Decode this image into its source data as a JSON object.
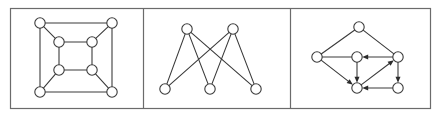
{
  "figure": {
    "title": "",
    "background_color": "#ffffff",
    "frame_color": "#6b6b6b",
    "edge_color": "#3b3b3b",
    "node_fill": "#ffffff",
    "node_stroke": "#3b3b3b",
    "node_radius": 5.2,
    "frame": {
      "x": 10,
      "y": 8,
      "width": 420,
      "height": 100
    },
    "dividers": [
      143,
      290
    ],
    "panels": [
      {
        "id": "panel-1",
        "name": "cube-graph-nested-squares",
        "type": "undirected",
        "node_count": 8,
        "edge_count": 12,
        "nodes": [
          {
            "id": "o-tl",
            "x": 40,
            "y": 23
          },
          {
            "id": "o-tr",
            "x": 112,
            "y": 23
          },
          {
            "id": "o-bl",
            "x": 40,
            "y": 92
          },
          {
            "id": "o-br",
            "x": 112,
            "y": 92
          },
          {
            "id": "i-tl",
            "x": 59,
            "y": 42
          },
          {
            "id": "i-tr",
            "x": 92,
            "y": 42
          },
          {
            "id": "i-bl",
            "x": 59,
            "y": 70
          },
          {
            "id": "i-br",
            "x": 92,
            "y": 70
          }
        ],
        "edges": [
          {
            "from": "o-tl",
            "to": "o-tr"
          },
          {
            "from": "o-tr",
            "to": "o-br"
          },
          {
            "from": "o-br",
            "to": "o-bl"
          },
          {
            "from": "o-bl",
            "to": "o-tl"
          },
          {
            "from": "i-tl",
            "to": "i-tr"
          },
          {
            "from": "i-tr",
            "to": "i-br"
          },
          {
            "from": "i-br",
            "to": "i-bl"
          },
          {
            "from": "i-bl",
            "to": "i-tl"
          },
          {
            "from": "o-tl",
            "to": "i-tl"
          },
          {
            "from": "o-tr",
            "to": "i-tr"
          },
          {
            "from": "o-bl",
            "to": "i-bl"
          },
          {
            "from": "o-br",
            "to": "i-br"
          }
        ]
      },
      {
        "id": "panel-2",
        "name": "complete-bipartite-graph-k23",
        "type": "undirected",
        "node_count": 5,
        "edge_count": 6,
        "nodes": [
          {
            "id": "t1",
            "x": 187,
            "y": 29
          },
          {
            "id": "t2",
            "x": 233,
            "y": 29
          },
          {
            "id": "b1",
            "x": 165,
            "y": 89
          },
          {
            "id": "b2",
            "x": 210,
            "y": 89
          },
          {
            "id": "b3",
            "x": 256,
            "y": 89
          }
        ],
        "edges": [
          {
            "from": "t1",
            "to": "b1"
          },
          {
            "from": "t1",
            "to": "b2"
          },
          {
            "from": "t1",
            "to": "b3"
          },
          {
            "from": "t2",
            "to": "b1"
          },
          {
            "from": "t2",
            "to": "b2"
          },
          {
            "from": "t2",
            "to": "b3"
          }
        ]
      },
      {
        "id": "panel-3",
        "name": "directed-graph-with-arrows",
        "type": "directed",
        "node_count": 6,
        "edge_count": 9,
        "nodes": [
          {
            "id": "top",
            "x": 359,
            "y": 27
          },
          {
            "id": "left",
            "x": 317,
            "y": 57
          },
          {
            "id": "center",
            "x": 357,
            "y": 57
          },
          {
            "id": "right",
            "x": 398,
            "y": 57
          },
          {
            "id": "bl",
            "x": 357,
            "y": 88
          },
          {
            "id": "br",
            "x": 398,
            "y": 88
          }
        ],
        "edges": [
          {
            "from": "left",
            "to": "top",
            "directed": false
          },
          {
            "from": "top",
            "to": "right",
            "directed": false
          },
          {
            "from": "left",
            "to": "center",
            "directed": false
          },
          {
            "from": "right",
            "to": "center",
            "directed": true
          },
          {
            "from": "left",
            "to": "bl",
            "directed": true
          },
          {
            "from": "center",
            "to": "bl",
            "directed": true
          },
          {
            "from": "bl",
            "to": "right",
            "directed": true
          },
          {
            "from": "right",
            "to": "br",
            "directed": true
          },
          {
            "from": "br",
            "to": "bl",
            "directed": true
          }
        ]
      }
    ]
  }
}
